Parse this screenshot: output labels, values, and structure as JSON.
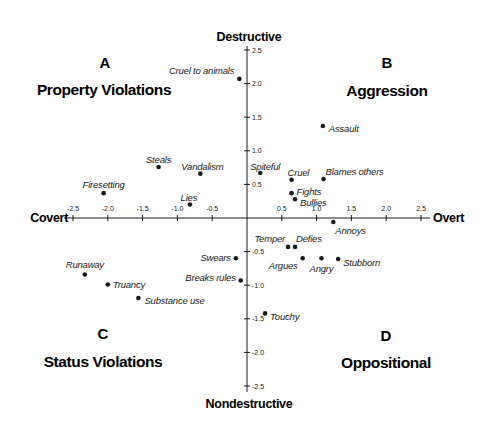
{
  "chart_data": {
    "type": "scatter",
    "title": "",
    "xlabel_left": "Covert",
    "xlabel_right": "Overt",
    "ylabel_top": "Destructive",
    "ylabel_bottom": "Nondestructive",
    "xlim": [
      -2.5,
      2.5
    ],
    "ylim": [
      -2.5,
      2.5
    ],
    "grid": false,
    "x_ticks": [
      -2.5,
      -2.0,
      -1.5,
      -1.0,
      -0.5,
      0.5,
      1.0,
      1.5,
      2.0,
      2.5
    ],
    "y_ticks": [
      2.5,
      2.0,
      1.5,
      1.0,
      0.5,
      -0.5,
      -1.0,
      -1.5,
      -2.0,
      -2.5
    ],
    "quadrants": [
      {
        "letter": "A",
        "title": "Property Violations",
        "position": "top-left"
      },
      {
        "letter": "B",
        "title": "Aggression",
        "position": "top-right"
      },
      {
        "letter": "C",
        "title": "Status Violations",
        "position": "bottom-left"
      },
      {
        "letter": "D",
        "title": "Oppositional",
        "position": "bottom-right"
      }
    ],
    "points": [
      {
        "label": "Cruel to animals",
        "x": -0.11,
        "y": 2.07,
        "lx": -5,
        "ly": -8,
        "anchor": "end"
      },
      {
        "label": "Assault",
        "x": 1.09,
        "y": 1.37,
        "lx": 6,
        "ly": 3,
        "anchor": "start"
      },
      {
        "label": "Steals",
        "x": -1.27,
        "y": 0.76,
        "lx": 0,
        "ly": -7,
        "anchor": "middle"
      },
      {
        "label": "Vandalism",
        "x": -0.67,
        "y": 0.66,
        "lx": 2,
        "ly": -7,
        "anchor": "middle"
      },
      {
        "label": "Firesetting",
        "x": -2.06,
        "y": 0.37,
        "lx": 0,
        "ly": -8,
        "anchor": "middle"
      },
      {
        "label": "Lies",
        "x": -0.82,
        "y": 0.2,
        "lx": -1,
        "ly": -7,
        "anchor": "middle"
      },
      {
        "label": "Spiteful",
        "x": 0.19,
        "y": 0.67,
        "lx": 5,
        "ly": -6,
        "anchor": "middle"
      },
      {
        "label": "Cruel",
        "x": 0.64,
        "y": 0.57,
        "lx": -4,
        "ly": -7,
        "anchor": "start"
      },
      {
        "label": "Blames others",
        "x": 1.1,
        "y": 0.58,
        "lx": 2,
        "ly": -7,
        "anchor": "start"
      },
      {
        "label": "Fights",
        "x": 0.64,
        "y": 0.37,
        "lx": 5,
        "ly": -1,
        "anchor": "start"
      },
      {
        "label": "Bullies",
        "x": 0.69,
        "y": 0.28,
        "lx": 5,
        "ly": 4,
        "anchor": "start"
      },
      {
        "label": "Annoys",
        "x": 1.24,
        "y": -0.06,
        "lx": 2,
        "ly": 9,
        "anchor": "start"
      },
      {
        "label": "Temper",
        "x": 0.59,
        "y": -0.43,
        "lx": -3,
        "ly": -8,
        "anchor": "end"
      },
      {
        "label": "Defies",
        "x": 0.69,
        "y": -0.43,
        "lx": 1,
        "ly": -8,
        "anchor": "start"
      },
      {
        "label": "Argues",
        "x": 0.8,
        "y": -0.6,
        "lx": -5,
        "ly": 8,
        "anchor": "end"
      },
      {
        "label": "Angry",
        "x": 1.07,
        "y": -0.6,
        "lx": 0,
        "ly": 11,
        "anchor": "middle"
      },
      {
        "label": "Stubborn",
        "x": 1.31,
        "y": -0.61,
        "lx": 5,
        "ly": 4,
        "anchor": "start"
      },
      {
        "label": "Touchy",
        "x": 0.26,
        "y": -1.42,
        "lx": 5,
        "ly": 4,
        "anchor": "start"
      },
      {
        "label": "Swears",
        "x": -0.16,
        "y": -0.6,
        "lx": -5,
        "ly": 0,
        "anchor": "end"
      },
      {
        "label": "Breaks rules",
        "x": -0.09,
        "y": -0.93,
        "lx": -5,
        "ly": -2,
        "anchor": "end"
      },
      {
        "label": "Runaway",
        "x": -2.33,
        "y": -0.84,
        "lx": 0,
        "ly": -9,
        "anchor": "middle"
      },
      {
        "label": "Truancy",
        "x": -2.0,
        "y": -0.99,
        "lx": 5,
        "ly": 0,
        "anchor": "start"
      },
      {
        "label": "Substance use",
        "x": -1.56,
        "y": -1.19,
        "lx": 6,
        "ly": 3,
        "anchor": "start"
      }
    ]
  },
  "colors": {
    "ink": "#1a1a1a",
    "background": "#ffffff"
  }
}
